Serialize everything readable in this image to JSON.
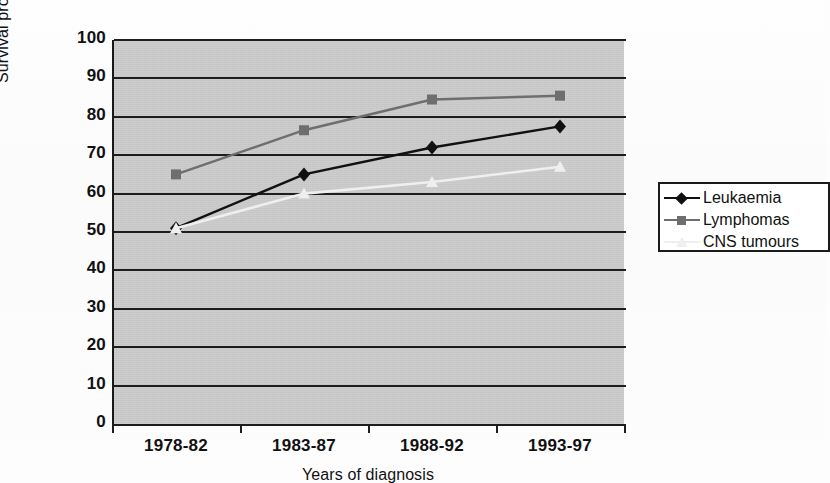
{
  "chart_data": {
    "type": "line",
    "title": "",
    "xlabel": "Years of diagnosis",
    "ylabel": "Survival probability (%)",
    "categories": [
      "1978-82",
      "1983-87",
      "1988-92",
      "1993-97"
    ],
    "ylim": [
      0,
      100
    ],
    "ytick_step": 10,
    "yticks": [
      100,
      90,
      80,
      70,
      60,
      50,
      40,
      30,
      20,
      10,
      0
    ],
    "grid": "horizontal",
    "legend_position": "right",
    "plot_background": "#c9c9c9",
    "series": [
      {
        "name": "Leukaemia",
        "color": "#111111",
        "marker": "diamond",
        "values": [
          51,
          65,
          72,
          77.5
        ]
      },
      {
        "name": "Lymphomas",
        "color": "#6e6e6e",
        "marker": "square",
        "values": [
          65,
          76.5,
          84.5,
          85.5
        ]
      },
      {
        "name": "CNS tumours",
        "color": "#efefef",
        "marker": "triangle",
        "values": [
          51,
          60,
          63,
          67
        ]
      }
    ]
  }
}
